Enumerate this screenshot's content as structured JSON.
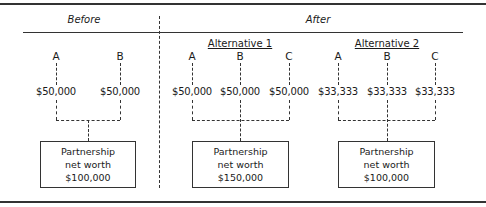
{
  "header": {
    "before": "Before",
    "after": "After"
  },
  "before": {
    "partners": [
      {
        "label": "A",
        "amount": "$50,000"
      },
      {
        "label": "B",
        "amount": "$50,000"
      }
    ],
    "box": {
      "line1": "Partnership",
      "line2": "net worth",
      "value": "$100,000"
    }
  },
  "alternative1": {
    "title": "Alternative 1",
    "partners": [
      {
        "label": "A",
        "amount": "$50,000"
      },
      {
        "label": "B",
        "amount": "$50,000"
      },
      {
        "label": "C",
        "amount": "$50,000"
      }
    ],
    "box": {
      "line1": "Partnership",
      "line2": "net worth",
      "value": "$150,000"
    }
  },
  "alternative2": {
    "title": "Alternative 2",
    "partners": [
      {
        "label": "A",
        "amount": "$33,333"
      },
      {
        "label": "B",
        "amount": "$33,333"
      },
      {
        "label": "C",
        "amount": "$33,333"
      }
    ],
    "box": {
      "line1": "Partnership",
      "line2": "net worth",
      "value": "$100,000"
    }
  }
}
